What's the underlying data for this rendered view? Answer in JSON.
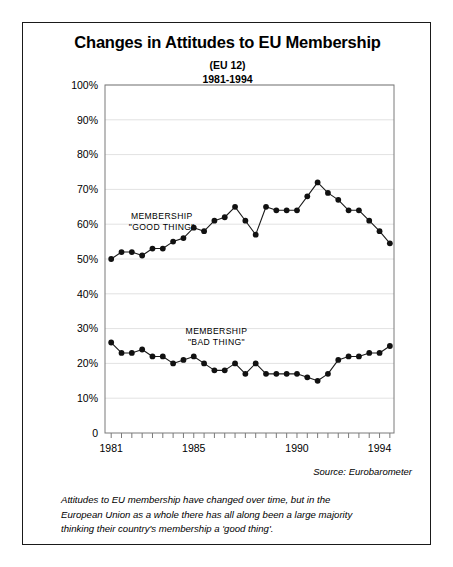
{
  "chart": {
    "title": "Changes in Attitudes to EU Membership",
    "subtitle_1": "(EU 12)",
    "subtitle_2": "1981-1994",
    "source": "Source: Eurobarometer",
    "caption_line_1": "Attitudes to EU membership have changed over time, but in the",
    "caption_line_2": "European Union as a whole there has all along been a large majority",
    "caption_line_3": "thinking their country's membership a 'good thing'."
  },
  "series_labels": {
    "good_line_1": "MEMBERSHIP",
    "good_line_2": "\"GOOD THING\"",
    "bad_line_1": "MEMBERSHIP",
    "bad_line_2": "\"BAD THING\""
  },
  "colors": {
    "line": "#1a1a1a",
    "marker": "#111111",
    "grid": "#e2e2e2",
    "axis": "#7a7a7a",
    "frame": "#1a1a1a",
    "text": "#000000"
  },
  "chart_data": {
    "type": "line",
    "title": "Changes in Attitudes to EU Membership",
    "subtitle": "(EU 12) 1981-1994",
    "xlabel": "",
    "ylabel": "",
    "xlim": [
      1980.6,
      1994.6
    ],
    "ylim": [
      0,
      100
    ],
    "ytick_values": [
      0,
      10,
      20,
      30,
      40,
      50,
      60,
      70,
      80,
      90,
      100
    ],
    "ytick_labels": [
      "0",
      "10%",
      "20%",
      "30%",
      "40%",
      "50%",
      "60%",
      "70%",
      "80%",
      "90%",
      "100%"
    ],
    "xtick_values": [
      1981,
      1985,
      1990,
      1994
    ],
    "xtick_labels": [
      "1981",
      "1985",
      "1990",
      "1994"
    ],
    "minor_xticks_per_year": 2,
    "grid": true,
    "grid_axis": "y",
    "legend": "inline-annotation",
    "x": [
      1980.9,
      1981.4,
      1981.9,
      1982.4,
      1982.9,
      1983.4,
      1983.9,
      1984.4,
      1984.9,
      1985.4,
      1985.9,
      1986.4,
      1986.9,
      1987.4,
      1987.9,
      1988.4,
      1988.9,
      1989.4,
      1989.9,
      1990.4,
      1990.9,
      1991.4,
      1991.9,
      1992.4,
      1992.9,
      1993.4,
      1993.9,
      1994.4
    ],
    "series": [
      {
        "name": "MEMBERSHIP \"GOOD THING\"",
        "values": [
          50,
          52,
          52,
          51,
          53,
          53,
          55,
          56,
          59,
          58,
          61,
          62,
          65,
          61,
          57,
          65,
          64,
          64,
          64,
          68,
          72,
          69,
          67,
          64,
          64,
          61,
          58,
          54.5
        ]
      },
      {
        "name": "MEMBERSHIP \"BAD THING\"",
        "values": [
          26,
          23,
          23,
          24,
          22,
          22,
          20,
          21,
          22,
          20,
          18,
          18,
          20,
          17,
          20,
          17,
          17,
          17,
          17,
          16,
          15,
          17,
          21,
          22,
          22,
          23,
          23,
          25
        ]
      }
    ]
  }
}
